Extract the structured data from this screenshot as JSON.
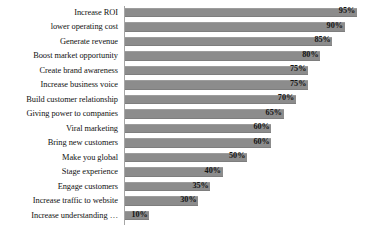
{
  "chart_data": {
    "type": "bar",
    "orientation": "horizontal",
    "title": "",
    "subtitle": "",
    "xlabel": "",
    "ylabel": "",
    "xlim": [
      0,
      100
    ],
    "grid": false,
    "legend": null,
    "value_suffix": "%",
    "categories": [
      "Increase ROI",
      "lower operating cost",
      "Generate revenue",
      "Boost market opportunity",
      "Create brand awareness",
      "Increase business voice",
      "Build customer relationship",
      "Giving power to companies",
      "Viral marketing",
      "Bring new customers",
      "Make you global",
      "Stage experience",
      "Engage customers",
      "Increase traffic to website",
      "Increase understanding …"
    ],
    "values": [
      95,
      90,
      85,
      80,
      75,
      75,
      70,
      65,
      60,
      60,
      50,
      40,
      35,
      30,
      10
    ],
    "data_labels": [
      "95%",
      "90%",
      "85%",
      "80%",
      "75%",
      "75%",
      "70%",
      "65%",
      "60%",
      "60%",
      "50%",
      "40%",
      "35%",
      "30%",
      "10%"
    ],
    "colors": {
      "bar": "#8c8c8c",
      "axis": "#a6a6a6",
      "text": "#111111",
      "background": "#ffffff"
    }
  }
}
